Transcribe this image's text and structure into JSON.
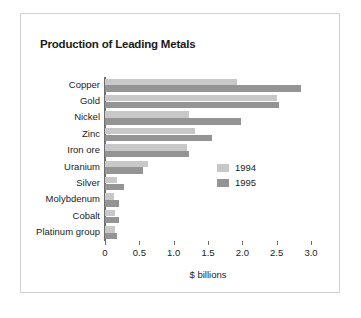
{
  "figure": {
    "background": "#ffffff",
    "border_color": "#d2d2d2"
  },
  "chart_data": {
    "type": "bar",
    "orientation": "horizontal",
    "title": "Production of Leading Metals",
    "xlabel": "$ billions",
    "ylabel": "",
    "xlim": [
      0,
      3.0
    ],
    "xticks": [
      "0",
      "0.5",
      "1.0",
      "1.5",
      "2.0",
      "2.5",
      "3.0"
    ],
    "xtick_values": [
      0,
      0.5,
      1.0,
      1.5,
      2.0,
      2.5,
      3.0
    ],
    "grid": false,
    "legend_position": "center-right",
    "categories": [
      "Copper",
      "Gold",
      "Nickel",
      "Zinc",
      "Iron ore",
      "Uranium",
      "Silver",
      "Molybdenum",
      "Cobalt",
      "Platinum group"
    ],
    "series": [
      {
        "name": "1994",
        "color": "#c8c8c8",
        "values": [
          1.92,
          2.5,
          1.23,
          1.31,
          1.2,
          0.62,
          0.17,
          0.13,
          0.14,
          0.14
        ]
      },
      {
        "name": "1995",
        "color": "#949494",
        "values": [
          2.86,
          2.53,
          1.98,
          1.56,
          1.22,
          0.55,
          0.28,
          0.2,
          0.2,
          0.18
        ]
      }
    ]
  },
  "legend": {
    "entries": [
      {
        "label": "1994",
        "color": "#c8c8c8"
      },
      {
        "label": "1995",
        "color": "#949494"
      }
    ]
  }
}
